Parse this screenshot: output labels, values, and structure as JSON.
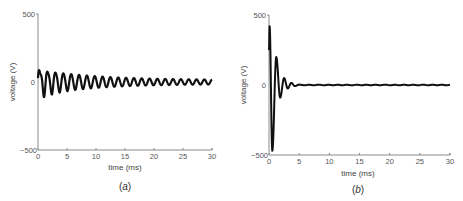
{
  "chart_data": [
    {
      "type": "line",
      "caption_prefix": "(",
      "caption_letter": "a",
      "caption_suffix": ")",
      "title": "",
      "xlabel": "time (ms)",
      "ylabel": "voltage (V)",
      "xlim": [
        0,
        30
      ],
      "ylim": [
        -500,
        500
      ],
      "xticks": [
        0,
        5,
        10,
        15,
        20,
        25,
        30
      ],
      "yticks": [
        -500,
        0,
        500
      ],
      "ytick_labels": [
        "−500",
        "0",
        "500"
      ],
      "xtick_labels": [
        "0",
        "5",
        "10",
        "15",
        "20",
        "25",
        "30"
      ],
      "series": [
        {
          "name": "voltage",
          "model": "damped_sine",
          "initial_amplitude_V": 100,
          "offset_V": 0,
          "period_ms": 1.35,
          "decay_time_constant_ms": 9,
          "end_amplitude_V": 15,
          "t_start_ms": 0,
          "t_end_ms": 30
        }
      ]
    },
    {
      "type": "line",
      "caption_prefix": "(",
      "caption_letter": "b",
      "caption_suffix": ")",
      "title": "",
      "xlabel": "time (ms)",
      "ylabel": "voltage (V)",
      "xlim": [
        0,
        30
      ],
      "ylim": [
        -500,
        500
      ],
      "xticks": [
        0,
        5,
        10,
        15,
        20,
        25,
        30
      ],
      "yticks": [
        -500,
        0,
        500
      ],
      "ytick_labels": [
        "−500",
        "0",
        "500"
      ],
      "xtick_labels": [
        "0",
        "5",
        "10",
        "15",
        "20",
        "25",
        "30"
      ],
      "series": [
        {
          "name": "voltage",
          "model": "damped_sine",
          "peak_points": [
            {
              "t": 0.1,
              "v": 420
            },
            {
              "t": 0.55,
              "v": -470
            },
            {
              "t": 1.2,
              "v": 200
            },
            {
              "t": 1.85,
              "v": -90
            },
            {
              "t": 2.5,
              "v": 50
            },
            {
              "t": 3.1,
              "v": -25
            },
            {
              "t": 3.7,
              "v": 15
            },
            {
              "t": 4.3,
              "v": -8
            },
            {
              "t": 5.0,
              "v": 3
            }
          ],
          "steady_value_V": 0,
          "t_start_ms": 0,
          "t_end_ms": 30
        }
      ]
    }
  ]
}
